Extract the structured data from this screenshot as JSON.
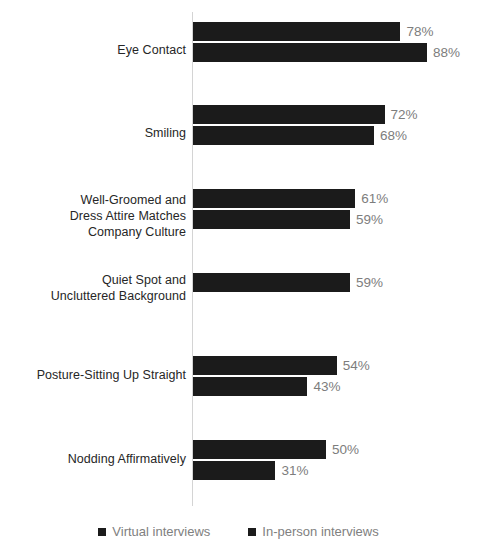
{
  "chart_data": {
    "type": "bar",
    "orientation": "horizontal",
    "title": "",
    "subtitle": "",
    "xlabel": "",
    "ylabel": "",
    "xlim": [
      0,
      100
    ],
    "grid": false,
    "legend_position": "bottom",
    "value_suffix": "%",
    "categories": [
      "Eye Contact",
      "Smiling",
      "Well-Groomed and Dress Attire Matches Company Culture",
      "Quiet Spot and Uncluttered Background",
      "Posture-Sitting Up Straight",
      "Nodding Affirmatively"
    ],
    "series": [
      {
        "name": "Virtual interviews",
        "values": [
          78,
          72,
          61,
          59,
          54,
          50
        ]
      },
      {
        "name": "In-person interviews",
        "values": [
          88,
          68,
          59,
          null,
          43,
          31
        ]
      }
    ],
    "colors": {
      "bar": "#1b1b1b",
      "value_label": "#7d7d7d",
      "category_label": "#262626",
      "axis_line": "#d4d4d4",
      "background": "#ffffff"
    }
  },
  "groups": [
    {
      "label_lines": [
        "Eye Contact"
      ],
      "top": 22,
      "label_top": 42,
      "bars": [
        {
          "series": "Virtual interviews",
          "value": 78,
          "value_text": "78%"
        },
        {
          "series": "In-person interviews",
          "value": 88,
          "value_text": "88%"
        }
      ]
    },
    {
      "label_lines": [
        "Smiling"
      ],
      "top": 105,
      "label_top": 125,
      "bars": [
        {
          "series": "Virtual interviews",
          "value": 72,
          "value_text": "72%"
        },
        {
          "series": "In-person interviews",
          "value": 68,
          "value_text": "68%"
        }
      ]
    },
    {
      "label_lines": [
        "Well-Groomed and",
        "Dress Attire Matches",
        "Company Culture"
      ],
      "top": 189,
      "label_top": 192,
      "bars": [
        {
          "series": "Virtual interviews",
          "value": 61,
          "value_text": "61%"
        },
        {
          "series": "In-person interviews",
          "value": 59,
          "value_text": "59%"
        }
      ]
    },
    {
      "label_lines": [
        "Quiet Spot and",
        "Uncluttered Background"
      ],
      "top": 273,
      "label_top": 272,
      "bars": [
        {
          "series": "Virtual interviews",
          "value": 59,
          "value_text": "59%"
        }
      ]
    },
    {
      "label_lines": [
        "Posture-Sitting Up Straight"
      ],
      "top": 356,
      "label_top": 367,
      "bars": [
        {
          "series": "Virtual interviews",
          "value": 54,
          "value_text": "54%"
        },
        {
          "series": "In-person interviews",
          "value": 43,
          "value_text": "43%"
        }
      ]
    },
    {
      "label_lines": [
        "Nodding Affirmatively"
      ],
      "top": 440,
      "label_top": 451,
      "bars": [
        {
          "series": "Virtual interviews",
          "value": 50,
          "value_text": "50%"
        },
        {
          "series": "In-person interviews",
          "value": 31,
          "value_text": "31%"
        }
      ]
    }
  ],
  "legend": {
    "items": [
      {
        "label": "Virtual interviews",
        "marker": "square-marker"
      },
      {
        "label": "In-person interviews",
        "marker": "square-marker"
      }
    ]
  },
  "scale": {
    "px_per_percent": 2.66,
    "axis_x": 193
  }
}
